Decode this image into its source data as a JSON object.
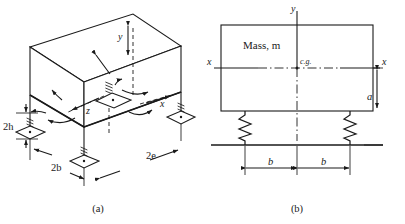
{
  "figure": {
    "background_color": "#ffffff",
    "line_color": "#1a1a1a",
    "panels": [
      {
        "id": "a",
        "caption": "(a)",
        "description": "Isometric view of rigid machine block supported on four isolator mounts",
        "labels": {
          "axis_y": "y",
          "axis_x": "x",
          "axis_z": "z",
          "dim_height": "2h",
          "dim_width": "2b",
          "dim_length": "2e"
        }
      },
      {
        "id": "b",
        "caption": "(b)",
        "description": "Elevation view of mass on two springs with c.g. location",
        "labels": {
          "mass_label": "Mass, m",
          "cg_label": "c.g.",
          "axis_y": "y",
          "axis_x_left": "x",
          "axis_x_right": "x",
          "dim_a": "a",
          "dim_b_left": "b",
          "dim_b_right": "b"
        }
      }
    ]
  }
}
